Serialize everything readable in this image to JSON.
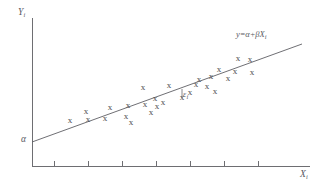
{
  "figure": {
    "title": "",
    "background_color": "#ffffff",
    "ink_color": "#5a5a5f"
  },
  "labels": {
    "y_axis": "Y",
    "y_axis_sub": "i",
    "x_axis": "X",
    "x_axis_sub": "i",
    "intercept": "α",
    "equation_prefix": "y",
    "equation_body": "=α+βX",
    "equation_sub": "i",
    "residual": "ε",
    "residual_sub": "i"
  },
  "chart_data": {
    "type": "scatter",
    "title": "",
    "xlabel": "X_i",
    "ylabel": "Y_i",
    "grid": false,
    "legend": false,
    "xlim": [
      0,
      324
    ],
    "ylim": [
      0,
      194
    ],
    "annotations": [
      {
        "name": "intercept-alpha",
        "text": "α",
        "x": 24,
        "y": 142
      },
      {
        "name": "regression-equation",
        "text": "y=α+βX_i",
        "x": 236,
        "y": 36
      },
      {
        "name": "residual-epsilon",
        "text": "ε_i",
        "x": 184,
        "y": 95
      }
    ],
    "axes": {
      "y_axis": {
        "x": 32,
        "y_top": 18,
        "y_bottom": 166
      },
      "x_axis": {
        "y": 166,
        "x_left": 32,
        "x_right": 310
      },
      "x_ticks": [
        54,
        88,
        122,
        156,
        190,
        224,
        258
      ],
      "tick_length": 5
    },
    "fit_line": {
      "name": "regression-line",
      "x0": 32,
      "y0": 142,
      "x1": 302,
      "y1": 44,
      "intercept_label": "α",
      "equation": "y=α+βX_i"
    },
    "residual_segment": {
      "x": 182,
      "y_top": 89,
      "y_bottom": 98
    },
    "marker_symbol": "x",
    "points": [
      {
        "x": 70,
        "y": 121
      },
      {
        "x": 86,
        "y": 112
      },
      {
        "x": 88,
        "y": 120
      },
      {
        "x": 105,
        "y": 119
      },
      {
        "x": 110,
        "y": 108
      },
      {
        "x": 126,
        "y": 117
      },
      {
        "x": 128,
        "y": 106
      },
      {
        "x": 131,
        "y": 123
      },
      {
        "x": 143,
        "y": 88
      },
      {
        "x": 145,
        "y": 105
      },
      {
        "x": 151,
        "y": 113
      },
      {
        "x": 155,
        "y": 99
      },
      {
        "x": 157,
        "y": 107
      },
      {
        "x": 163,
        "y": 103
      },
      {
        "x": 169,
        "y": 86
      },
      {
        "x": 182,
        "y": 98
      },
      {
        "x": 190,
        "y": 93
      },
      {
        "x": 196,
        "y": 85
      },
      {
        "x": 199,
        "y": 80
      },
      {
        "x": 207,
        "y": 87
      },
      {
        "x": 211,
        "y": 77
      },
      {
        "x": 215,
        "y": 92
      },
      {
        "x": 219,
        "y": 70
      },
      {
        "x": 228,
        "y": 79
      },
      {
        "x": 235,
        "y": 72
      },
      {
        "x": 238,
        "y": 59
      },
      {
        "x": 250,
        "y": 60
      },
      {
        "x": 252,
        "y": 73
      }
    ]
  }
}
